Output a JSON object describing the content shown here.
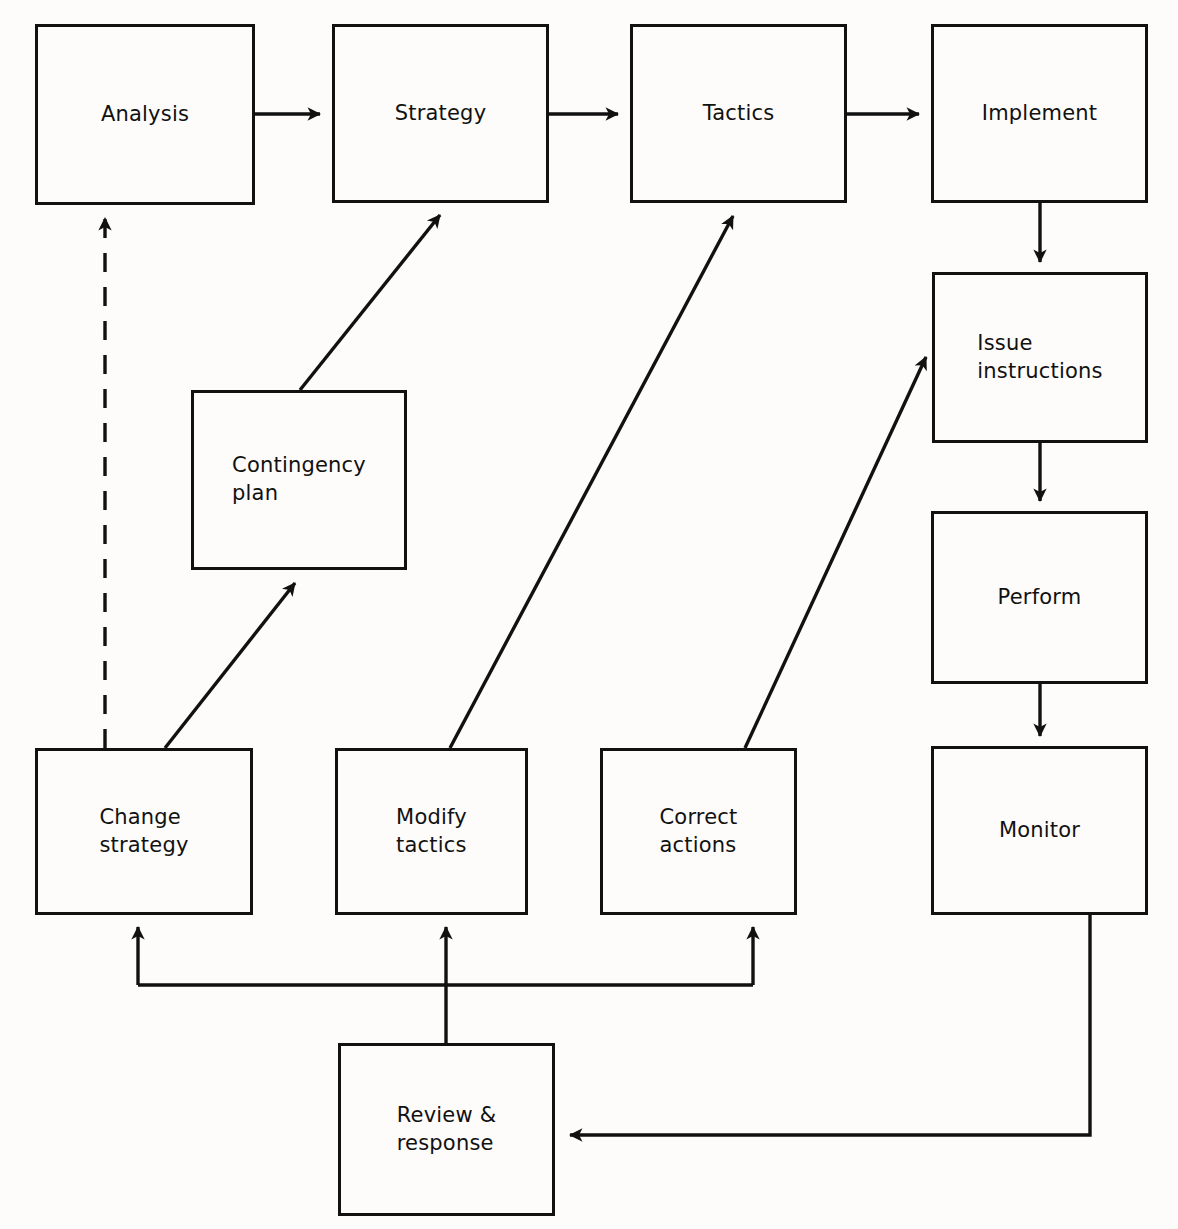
{
  "diagram": {
    "type": "flowchart",
    "style": {
      "box_stroke": "#111111",
      "arrow_stroke": "#111111",
      "background": "#fdfcfa",
      "box_fill": "none",
      "line_width_px": 3
    },
    "nodes": [
      {
        "id": "analysis",
        "label": "Analysis",
        "x": 35,
        "y": 24,
        "w": 220,
        "h": 181,
        "align": "center"
      },
      {
        "id": "strategy",
        "label": "Strategy",
        "x": 332,
        "y": 24,
        "w": 217,
        "h": 179,
        "align": "center"
      },
      {
        "id": "tactics",
        "label": "Tactics",
        "x": 630,
        "y": 24,
        "w": 217,
        "h": 179,
        "align": "center"
      },
      {
        "id": "implement",
        "label": "Implement",
        "x": 931,
        "y": 24,
        "w": 217,
        "h": 179,
        "align": "center"
      },
      {
        "id": "issue",
        "label": "Issue\ninstructions",
        "x": 932,
        "y": 272,
        "w": 216,
        "h": 171,
        "align": "left"
      },
      {
        "id": "perform",
        "label": "Perform",
        "x": 931,
        "y": 511,
        "w": 217,
        "h": 173,
        "align": "center"
      },
      {
        "id": "monitor",
        "label": "Monitor",
        "x": 931,
        "y": 746,
        "w": 217,
        "h": 169,
        "align": "center"
      },
      {
        "id": "contingency",
        "label": "Contingency\nplan",
        "x": 191,
        "y": 390,
        "w": 216,
        "h": 180,
        "align": "left"
      },
      {
        "id": "change",
        "label": "Change\nstrategy",
        "x": 35,
        "y": 748,
        "w": 218,
        "h": 167,
        "align": "left"
      },
      {
        "id": "modify",
        "label": "Modify\ntactics",
        "x": 335,
        "y": 748,
        "w": 193,
        "h": 167,
        "align": "left"
      },
      {
        "id": "correct",
        "label": "Correct\nactions",
        "x": 600,
        "y": 748,
        "w": 197,
        "h": 167,
        "align": "left"
      },
      {
        "id": "review",
        "label": "Review &\nresponse",
        "x": 338,
        "y": 1043,
        "w": 217,
        "h": 173,
        "align": "left"
      }
    ],
    "edges": [
      {
        "id": "analysis-to-strategy",
        "from": "analysis",
        "to": "strategy",
        "style": "solid",
        "shape": "horizontal"
      },
      {
        "id": "strategy-to-tactics",
        "from": "strategy",
        "to": "tactics",
        "style": "solid",
        "shape": "horizontal"
      },
      {
        "id": "tactics-to-implement",
        "from": "tactics",
        "to": "implement",
        "style": "solid",
        "shape": "horizontal"
      },
      {
        "id": "implement-to-issue",
        "from": "implement",
        "to": "issue",
        "style": "solid",
        "shape": "vertical"
      },
      {
        "id": "issue-to-perform",
        "from": "issue",
        "to": "perform",
        "style": "solid",
        "shape": "vertical"
      },
      {
        "id": "perform-to-monitor",
        "from": "perform",
        "to": "monitor",
        "style": "solid",
        "shape": "vertical"
      },
      {
        "id": "monitor-to-review",
        "from": "monitor",
        "to": "review",
        "style": "solid",
        "shape": "orthogonal"
      },
      {
        "id": "review-to-bus",
        "from": "review",
        "to": "feedback-bus",
        "style": "solid",
        "shape": "vertical"
      },
      {
        "id": "bus-to-change",
        "from": "feedback-bus",
        "to": "change",
        "style": "solid",
        "shape": "orthogonal"
      },
      {
        "id": "bus-to-modify",
        "from": "feedback-bus",
        "to": "modify",
        "style": "solid",
        "shape": "vertical"
      },
      {
        "id": "bus-to-correct",
        "from": "feedback-bus",
        "to": "correct",
        "style": "solid",
        "shape": "orthogonal"
      },
      {
        "id": "change-to-analysis",
        "from": "change",
        "to": "analysis",
        "style": "dashed",
        "shape": "vertical"
      },
      {
        "id": "change-to-contingency",
        "from": "change",
        "to": "contingency",
        "style": "solid",
        "shape": "diagonal"
      },
      {
        "id": "contingency-to-strategy",
        "from": "contingency",
        "to": "strategy",
        "style": "solid",
        "shape": "diagonal"
      },
      {
        "id": "modify-to-tactics",
        "from": "modify",
        "to": "tactics",
        "style": "solid",
        "shape": "diagonal"
      },
      {
        "id": "correct-to-issue",
        "from": "correct",
        "to": "issue",
        "style": "solid",
        "shape": "diagonal"
      }
    ]
  }
}
